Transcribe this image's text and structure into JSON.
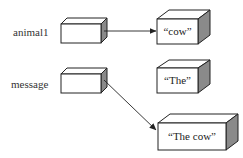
{
  "diagram": {
    "type": "reference-variable-memory-diagram",
    "variables": [
      {
        "name": "animal1",
        "points_to": "cow"
      },
      {
        "name": "message",
        "points_to": "The cow"
      }
    ],
    "objects": [
      {
        "id": "cow",
        "label": "“cow”"
      },
      {
        "id": "the",
        "label": "“The”"
      },
      {
        "id": "thecow",
        "label": "“The cow”"
      }
    ],
    "colors": {
      "outline": "#222222",
      "side_face": "#8a8a8a",
      "face": "#ffffff",
      "text": "#333333"
    }
  }
}
